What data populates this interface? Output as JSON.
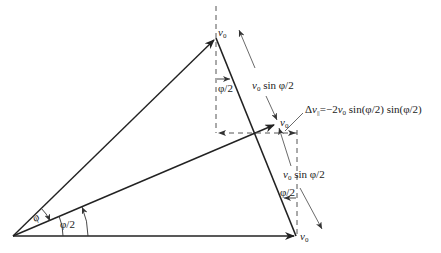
{
  "diagram": {
    "title": "",
    "vectors": {
      "top": {
        "label": "v",
        "subscript": "0"
      },
      "middle": {
        "label": "v",
        "subscript": "0"
      },
      "bottom": {
        "label": "v",
        "subscript": "0"
      }
    },
    "angles": {
      "full": "φ",
      "half_base": "φ/2",
      "half_top": "φ/2",
      "half_right": "φ/2"
    },
    "dimensions": {
      "upper": {
        "prefix": "v",
        "subscript": "0",
        "suffix": " sin  φ/2"
      },
      "lower": {
        "prefix": "v",
        "subscript": "0",
        "suffix": " sin  φ/2"
      }
    },
    "delta_label": {
      "prefix": "Δ",
      "var": "v",
      "subscript": "||",
      "rhs": "=−2",
      "rhs_var": "v",
      "rhs_sub": "0",
      "rhs_tail": " sin(φ/2) sin(φ/2)"
    },
    "colors": {
      "line": "#222222",
      "dashed": "#555555",
      "thin": "#444444"
    }
  }
}
